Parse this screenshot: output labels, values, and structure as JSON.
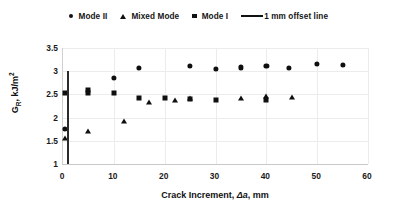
{
  "chart_data": {
    "type": "scatter",
    "title": "",
    "xlabel": "Crack Increment, Δa, mm",
    "ylabel": "GR, kJ/m²",
    "xlim": [
      0,
      60
    ],
    "ylim": [
      1,
      3.5
    ],
    "xticks": [
      0,
      10,
      20,
      30,
      40,
      50,
      60
    ],
    "yticks": [
      1,
      1.5,
      2,
      2.5,
      3,
      3.5
    ],
    "xtick_labels": [
      "0",
      "10",
      "20",
      "30",
      "40",
      "50",
      "60"
    ],
    "ytick_labels": [
      "1",
      "1.5",
      "2",
      "2.5",
      "3",
      "3.5"
    ],
    "grid": true,
    "legend_position": "top-center",
    "series": [
      {
        "name": "Mode II",
        "marker": "circle",
        "color": "#0f0f0f",
        "points": [
          {
            "x": 0.4,
            "y": 1.76
          },
          {
            "x": 10.0,
            "y": 2.85
          },
          {
            "x": 15.0,
            "y": 3.07
          },
          {
            "x": 25.0,
            "y": 3.12
          },
          {
            "x": 30.0,
            "y": 3.05
          },
          {
            "x": 35.0,
            "y": 3.08
          },
          {
            "x": 40.0,
            "y": 3.12
          },
          {
            "x": 44.5,
            "y": 3.07
          },
          {
            "x": 50.0,
            "y": 3.15
          },
          {
            "x": 55.0,
            "y": 3.13
          }
        ]
      },
      {
        "name": "Mixed Mode",
        "marker": "triangle",
        "color": "#0f0f0f",
        "points": [
          {
            "x": 0.4,
            "y": 1.55
          },
          {
            "x": 5.0,
            "y": 1.72
          },
          {
            "x": 12.0,
            "y": 1.93
          },
          {
            "x": 17.0,
            "y": 2.33
          },
          {
            "x": 22.0,
            "y": 2.38
          },
          {
            "x": 25.0,
            "y": 2.42
          },
          {
            "x": 35.0,
            "y": 2.42
          },
          {
            "x": 40.0,
            "y": 2.46
          },
          {
            "x": 45.0,
            "y": 2.44
          }
        ]
      },
      {
        "name": "Mode I",
        "marker": "square",
        "color": "#0f0f0f",
        "points": [
          {
            "x": 0.4,
            "y": 2.52
          },
          {
            "x": 5.0,
            "y": 2.59
          },
          {
            "x": 5.0,
            "y": 2.52
          },
          {
            "x": 10.0,
            "y": 2.52
          },
          {
            "x": 15.0,
            "y": 2.43
          },
          {
            "x": 20.0,
            "y": 2.43
          },
          {
            "x": 25.0,
            "y": 2.41
          },
          {
            "x": 30.0,
            "y": 2.39
          },
          {
            "x": 40.0,
            "y": 2.39
          }
        ]
      },
      {
        "name": "1 mm offset line",
        "marker": "line",
        "color": "#2b2b2b",
        "points": [
          {
            "x": 1.0,
            "y": 1.0
          },
          {
            "x": 1.0,
            "y": 3.0
          }
        ]
      }
    ]
  },
  "legend": {
    "entries": [
      {
        "label": "Mode II",
        "marker": "circle"
      },
      {
        "label": "Mixed Mode",
        "marker": "triangle"
      },
      {
        "label": "Mode I",
        "marker": "square"
      },
      {
        "label": "1 mm offset line",
        "marker": "line"
      }
    ]
  },
  "axes": {
    "x_title_prefix": "Crack Increment, ",
    "x_title_symbol": "Δa",
    "x_title_suffix": ", mm",
    "y_title_main": "G",
    "y_title_sub": "R",
    "y_title_rest": ", kJ/m",
    "y_title_sup": "2"
  }
}
